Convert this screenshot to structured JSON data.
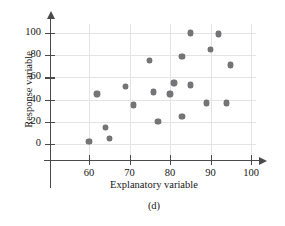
{
  "figure": {
    "panel_caption": "(d)",
    "point_color": "#757578",
    "grid_color": "#e4e4e4",
    "axis_color": "#4a4a4a"
  },
  "chart_data": {
    "type": "scatter",
    "title": "",
    "subtitle": "",
    "panel_label": "(d)",
    "xlabel": "Explanatory variable",
    "ylabel": "Response variable",
    "xlim": [
      52,
      104
    ],
    "ylim": [
      -12,
      108
    ],
    "xticks": [
      60,
      70,
      80,
      90,
      100
    ],
    "yticks": [
      0,
      20,
      40,
      60,
      80,
      100
    ],
    "xticklabels": [
      "60",
      "70",
      "80",
      "90",
      "100"
    ],
    "yticklabels": [
      "0",
      "20",
      "40",
      "60",
      "80",
      "100"
    ],
    "grid": true,
    "legend": null,
    "annotations": [],
    "series": [
      {
        "name": "observations",
        "marker": "circle",
        "color": "#757578",
        "points": [
          {
            "x": 60,
            "y": 2
          },
          {
            "x": 62,
            "y": 45
          },
          {
            "x": 64,
            "y": 15
          },
          {
            "x": 65,
            "y": 5
          },
          {
            "x": 69,
            "y": 52
          },
          {
            "x": 71,
            "y": 35
          },
          {
            "x": 75,
            "y": 75
          },
          {
            "x": 76,
            "y": 47
          },
          {
            "x": 77,
            "y": 20
          },
          {
            "x": 80,
            "y": 45
          },
          {
            "x": 81,
            "y": 55
          },
          {
            "x": 83,
            "y": 25
          },
          {
            "x": 83,
            "y": 79
          },
          {
            "x": 85,
            "y": 53
          },
          {
            "x": 85,
            "y": 100
          },
          {
            "x": 89,
            "y": 37
          },
          {
            "x": 90,
            "y": 85
          },
          {
            "x": 92,
            "y": 99
          },
          {
            "x": 94,
            "y": 37
          },
          {
            "x": 95,
            "y": 71
          }
        ]
      }
    ]
  }
}
